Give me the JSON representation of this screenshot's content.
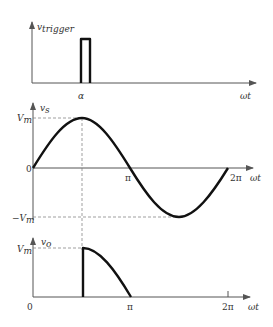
{
  "panels": {
    "trigger": {
      "y_label_main": "v",
      "y_label_sub": "trigger",
      "x_label": "ωt",
      "alpha_label": "α"
    },
    "source": {
      "y_label_main": "v",
      "y_label_sub": "s",
      "x_label": "ωt",
      "origin_label": "0",
      "vm_label": "V",
      "vm_sub": "m",
      "neg_vm_label": "−V",
      "neg_vm_sub": "m",
      "pi_label": "π",
      "two_pi_label": "2π"
    },
    "output": {
      "y_label_main": "v",
      "y_label_sub": "o",
      "x_label": "ωt",
      "origin_label": "0",
      "vm_label": "V",
      "vm_sub": "m",
      "pi_label": "π",
      "two_pi_label": "2π"
    }
  },
  "colors": {
    "wave": "#111111",
    "axis": "#555555",
    "dash": "#777777"
  }
}
